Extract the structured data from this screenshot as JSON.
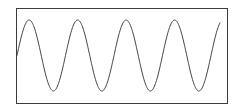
{
  "figure": {
    "title": "",
    "background_color": "#ffffff",
    "width": 242,
    "height": 112
  },
  "frame": {
    "label": "plot-border",
    "x": 16,
    "y": 8,
    "width": 211,
    "height": 95,
    "stroke_color": "#3c3c3c",
    "stroke_width": 1,
    "fill_color": "#ffffff"
  },
  "curve": {
    "label": "sine-wave",
    "stroke_color": "#444444",
    "stroke_width": 1
  },
  "chart_data": {
    "type": "line",
    "title": "",
    "xlabel": "",
    "ylabel": "",
    "grid": false,
    "legend": null,
    "axis_ticks": false,
    "axis_tick_labels": [],
    "xlim": [
      0,
      4.18
    ],
    "ylim": [
      -1,
      1
    ],
    "waveform": {
      "function": "sine",
      "amplitude": 1.0,
      "cycles": 4.18,
      "phase_deg": 0,
      "peaks_x_px": [
        38,
        83,
        133,
        184
      ],
      "peaks_y_px": [
        20,
        20,
        20,
        20
      ],
      "troughs_x_px": [
        60,
        108,
        157,
        207
      ],
      "troughs_y_px": [
        91,
        91,
        91,
        91
      ],
      "midline_y_px": 55.5,
      "period_px": 48.5,
      "amplitude_px": 35.5,
      "start_point_px": [
        17,
        55
      ],
      "end_point_px": [
        220,
        52
      ]
    },
    "series": [
      {
        "name": "sine",
        "x": [
          0,
          0.125,
          0.25,
          0.375,
          0.5,
          0.625,
          0.75,
          0.875,
          1,
          1.125,
          1.25,
          1.375,
          1.5,
          1.625,
          1.75,
          1.875,
          2,
          2.125,
          2.25,
          2.375,
          2.5,
          2.625,
          2.75,
          2.875,
          3,
          3.125,
          3.25,
          3.375,
          3.5,
          3.625,
          3.75,
          3.875,
          4,
          4.09,
          4.18
        ],
        "values": [
          0,
          0.707,
          1,
          0.707,
          0,
          -0.707,
          -1,
          -0.707,
          0,
          0.707,
          1,
          0.707,
          0,
          -0.707,
          -1,
          -0.707,
          0,
          0.707,
          1,
          0.707,
          0,
          -0.707,
          -1,
          -0.707,
          0,
          0.707,
          1,
          0.707,
          0,
          -0.707,
          -1,
          -0.707,
          0,
          0.05,
          0.1
        ]
      }
    ]
  }
}
